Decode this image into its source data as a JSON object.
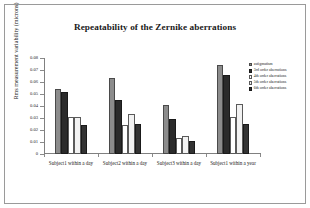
{
  "chart_data": {
    "type": "bar",
    "title": "Repeatability of the Zernike aberrations",
    "xlabel": "",
    "ylabel": "Rms measurement variability (microns)",
    "ylim": [
      0,
      0.08
    ],
    "yticks": [
      "0",
      "0.01",
      "0.02",
      "0.03",
      "0.04",
      "0.05",
      "0.06",
      "0.07",
      "0.08"
    ],
    "ytick_values": [
      0,
      0.01,
      0.02,
      0.03,
      0.04,
      0.05,
      0.06,
      0.07,
      0.08
    ],
    "grid": false,
    "legend_position": "right",
    "categories": [
      "Subject1 within a day",
      "Subject2 within a day",
      "Subject3 within a day",
      "Subject1 within a year"
    ],
    "series": [
      {
        "name": "astigmatism",
        "color": "#8c8c8c",
        "border": "#4a4a4a",
        "values": [
          0.054,
          0.063,
          0.041,
          0.074
        ]
      },
      {
        "name": "3rd order aberrations",
        "color": "#2b2b2b",
        "border": "#1a1a1a",
        "values": [
          0.052,
          0.045,
          0.029,
          0.066
        ]
      },
      {
        "name": "4th order aberrations",
        "color": "#ffffff",
        "border": "#5a5a5a",
        "values": [
          0.031,
          0.024,
          0.013,
          0.031
        ]
      },
      {
        "name": "5th order aberrations",
        "color": "#f2f2f2",
        "border": "#5a5a5a",
        "values": [
          0.031,
          0.033,
          0.015,
          0.042
        ]
      },
      {
        "name": "6th order aberrations",
        "color": "#333333",
        "border": "#1a1a1a",
        "values": [
          0.024,
          0.025,
          0.011,
          0.025
        ]
      }
    ]
  },
  "colors": {
    "frame": "#9a9a9a",
    "axis": "#808080",
    "text": "#1a1a1a",
    "background": "#ffffff"
  }
}
